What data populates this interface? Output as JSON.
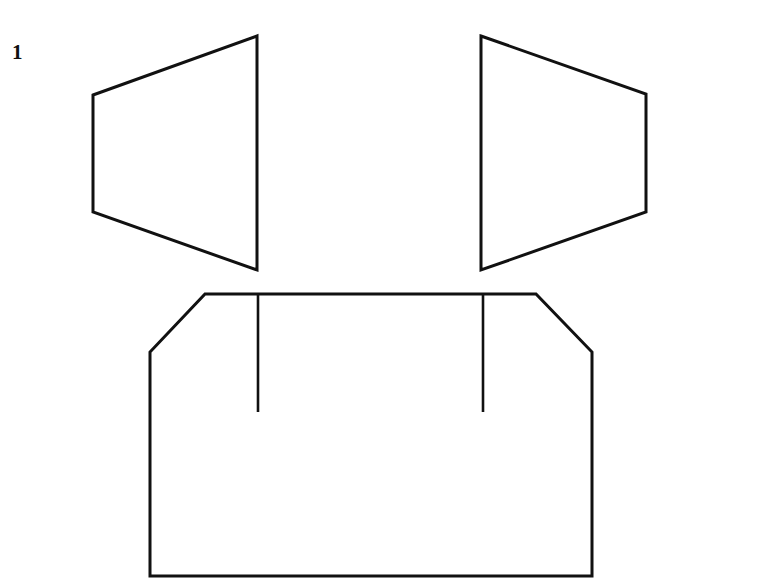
{
  "figure": {
    "label": "1",
    "sheet": {
      "width": 764,
      "height": 582,
      "background_color": "#ffffff"
    },
    "style": {
      "stroke_color": "#111111",
      "fill_color": "none",
      "stroke_width_outline": 3,
      "stroke_width_tick": 2.6
    },
    "parts": [
      {
        "name": "left-panel",
        "shape": "trapezoid",
        "points": "93,95 257,36 257,270 93,212",
        "stroke_width": 3
      },
      {
        "name": "right-panel",
        "shape": "trapezoid",
        "points": "481,36 646,94 646,212 481,270",
        "stroke_width": 3
      },
      {
        "name": "base-body",
        "shape": "chamfered-polygon",
        "points": "205,294 536,294 592,352 592,576 150,576 150,352",
        "stroke_width": 3
      },
      {
        "name": "left-fold-line",
        "shape": "line",
        "points": "258,294 258,412",
        "stroke_width": 2.6
      },
      {
        "name": "right-fold-line",
        "shape": "line",
        "points": "483,294 483,412",
        "stroke_width": 2.6
      }
    ]
  }
}
